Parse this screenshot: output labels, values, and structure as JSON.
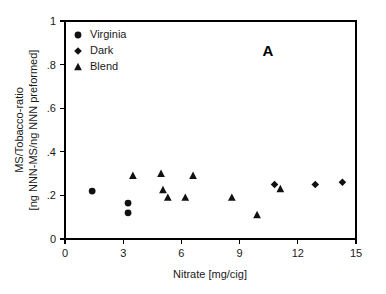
{
  "chart_data": {
    "type": "scatter",
    "title": "",
    "panel_label": "A",
    "xlabel": "Nitrate [mg/cig]",
    "ylabel_line1": "MS/Tobacco-ratio",
    "ylabel_line2": "[ng NNN-MS/ng NNN preformed]",
    "xlim": [
      0,
      15
    ],
    "ylim": [
      0,
      1
    ],
    "xticks": [
      0,
      3,
      6,
      9,
      12,
      15
    ],
    "xtick_labels": [
      "0",
      "3",
      "6",
      "9",
      "12",
      "15"
    ],
    "yticks": [
      0,
      0.2,
      0.4,
      0.6,
      0.8,
      1
    ],
    "ytick_labels": [
      "0",
      ".2",
      ".4",
      ".6",
      ".8",
      "1"
    ],
    "grid": false,
    "legend_position": "top-left",
    "series": [
      {
        "name": "Virginia",
        "marker": "circle",
        "color": "#111111",
        "points": [
          {
            "x": 1.4,
            "y": 0.22
          },
          {
            "x": 3.25,
            "y": 0.165
          },
          {
            "x": 3.25,
            "y": 0.12
          }
        ]
      },
      {
        "name": "Dark",
        "marker": "diamond",
        "color": "#111111",
        "points": [
          {
            "x": 10.8,
            "y": 0.25
          },
          {
            "x": 12.9,
            "y": 0.25
          },
          {
            "x": 14.3,
            "y": 0.26
          }
        ]
      },
      {
        "name": "Blend",
        "marker": "triangle",
        "color": "#111111",
        "points": [
          {
            "x": 3.5,
            "y": 0.29
          },
          {
            "x": 4.95,
            "y": 0.3
          },
          {
            "x": 5.05,
            "y": 0.225
          },
          {
            "x": 5.3,
            "y": 0.19
          },
          {
            "x": 6.2,
            "y": 0.19
          },
          {
            "x": 6.6,
            "y": 0.29
          },
          {
            "x": 8.6,
            "y": 0.19
          },
          {
            "x": 9.9,
            "y": 0.11
          },
          {
            "x": 11.1,
            "y": 0.23
          }
        ]
      }
    ]
  }
}
